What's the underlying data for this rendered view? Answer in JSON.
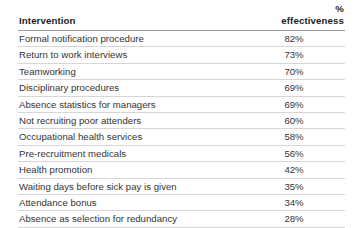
{
  "table": {
    "columns": [
      {
        "key": "intervention",
        "label": "Intervention",
        "align": "left"
      },
      {
        "key": "effectiveness",
        "label": "% effectiveness",
        "align": "right"
      }
    ],
    "rows": [
      {
        "intervention": "Formal notification procedure",
        "effectiveness": "82%"
      },
      {
        "intervention": "Return to work interviews",
        "effectiveness": "73%"
      },
      {
        "intervention": "Teamworking",
        "effectiveness": "70%"
      },
      {
        "intervention": "Disciplinary procedures",
        "effectiveness": "69%"
      },
      {
        "intervention": "Absence statistics for managers",
        "effectiveness": "69%"
      },
      {
        "intervention": "Not recruiting poor attenders",
        "effectiveness": "60%"
      },
      {
        "intervention": "Occupational health services",
        "effectiveness": "58%"
      },
      {
        "intervention": "Pre-recruitment medicals",
        "effectiveness": "56%"
      },
      {
        "intervention": "Health promotion",
        "effectiveness": "42%"
      },
      {
        "intervention": "Waiting days before sick pay is given",
        "effectiveness": "35%"
      },
      {
        "intervention": "Attendance bonus",
        "effectiveness": "34%"
      },
      {
        "intervention": "Absence as selection for redundancy",
        "effectiveness": "28%"
      }
    ]
  },
  "chart_data": {
    "type": "table",
    "title": "",
    "categories": [
      "Formal notification procedure",
      "Return to work interviews",
      "Teamworking",
      "Disciplinary procedures",
      "Absence statistics for managers",
      "Not recruiting poor attenders",
      "Occupational health services",
      "Pre-recruitment medicals",
      "Health promotion",
      "Waiting days before sick pay is given",
      "Attendance bonus",
      "Absence as selection for redundancy"
    ],
    "values": [
      82,
      73,
      70,
      69,
      69,
      60,
      58,
      56,
      42,
      35,
      34,
      28
    ],
    "xlabel": "Intervention",
    "ylabel": "% effectiveness",
    "ylim": [
      0,
      100
    ],
    "grid": false,
    "legend": false
  },
  "colors": {
    "background": "#ffffff",
    "text": "#333333",
    "header_text": "#1d1d1d",
    "header_rule": "#9a9a9a",
    "row_rule": "#d6d6d6"
  }
}
